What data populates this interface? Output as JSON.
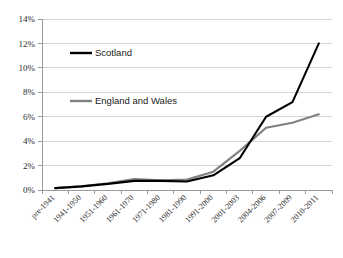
{
  "chart_data": {
    "type": "line",
    "title": "",
    "subtitle": "",
    "xlabel": "",
    "ylabel": "",
    "grid": true,
    "legend_position": "inside-upper-left",
    "categories": [
      "pre-1941",
      "1941-1950",
      "1951-1960",
      "1961-1970",
      "1971-1980",
      "1981-1990",
      "1991-2000",
      "2001-2003",
      "2004-2006",
      "2007-2009",
      "2010-2011"
    ],
    "ylim": [
      0,
      14
    ],
    "ytick_labels": [
      "0%",
      "2%",
      "4%",
      "6%",
      "8%",
      "10%",
      "12%",
      "14%"
    ],
    "ytick_values": [
      0,
      2,
      4,
      6,
      8,
      10,
      12,
      14
    ],
    "series": [
      {
        "name": "Scotland",
        "color": "#000000",
        "values": [
          0.15,
          0.3,
          0.5,
          0.75,
          0.75,
          0.7,
          1.2,
          2.6,
          6.0,
          7.2,
          12.0
        ]
      },
      {
        "name": "England and Wales",
        "color": "#808080",
        "values": [
          0.15,
          0.3,
          0.55,
          0.9,
          0.8,
          0.85,
          1.5,
          3.2,
          5.1,
          5.5,
          6.2
        ]
      }
    ]
  },
  "legend": {
    "entries": [
      {
        "label": "Scotland",
        "color": "#000000"
      },
      {
        "label": "England and Wales",
        "color": "#808080"
      }
    ]
  },
  "axes": {
    "y_ticks": [
      "14%",
      "12%",
      "10%",
      "8%",
      "6%",
      "4%",
      "2%",
      "0%"
    ],
    "x_ticks": [
      "pre-1941",
      "1941-1950",
      "1951-1960",
      "1961-1970",
      "1971-1980",
      "1981-1990",
      "1991-2000",
      "2001-2003",
      "2004-2006",
      "2007-2009",
      "2010-2011"
    ]
  }
}
